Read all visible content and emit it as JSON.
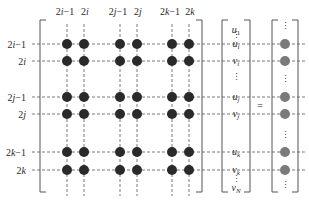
{
  "diagram": {
    "column_labels": [
      {
        "pre": "2",
        "var": "i",
        "post": "−1"
      },
      {
        "pre": "2",
        "var": "i",
        "post": ""
      },
      {
        "pre": "2",
        "var": "j",
        "post": "−1"
      },
      {
        "pre": "2",
        "var": "j",
        "post": ""
      },
      {
        "pre": "2",
        "var": "k",
        "post": "−1"
      },
      {
        "pre": "2",
        "var": "k",
        "post": ""
      }
    ],
    "row_labels": [
      {
        "pre": "2",
        "var": "i",
        "post": "−1"
      },
      {
        "pre": "2",
        "var": "i",
        "post": ""
      },
      {
        "pre": "2",
        "var": "j",
        "post": "−1"
      },
      {
        "pre": "2",
        "var": "j",
        "post": ""
      },
      {
        "pre": "2",
        "var": "k",
        "post": "−1"
      },
      {
        "pre": "2",
        "var": "k",
        "post": ""
      }
    ],
    "vector_entries": [
      {
        "base": "u",
        "sub": "1"
      },
      {
        "base": "u",
        "sub": "i"
      },
      {
        "base": "v",
        "sub": "i"
      },
      {
        "base": "u",
        "sub": "j"
      },
      {
        "base": "v",
        "sub": "j"
      },
      {
        "base": "u",
        "sub": "k"
      },
      {
        "base": "v",
        "sub": "k"
      },
      {
        "base": "v",
        "sub": "N"
      }
    ],
    "equals_sign": "=",
    "ellipsis": "⋮",
    "colors": {
      "matrix_dot": "#2a2a2a",
      "result_dot": "#7a7a7a",
      "lines": "#555555"
    }
  }
}
